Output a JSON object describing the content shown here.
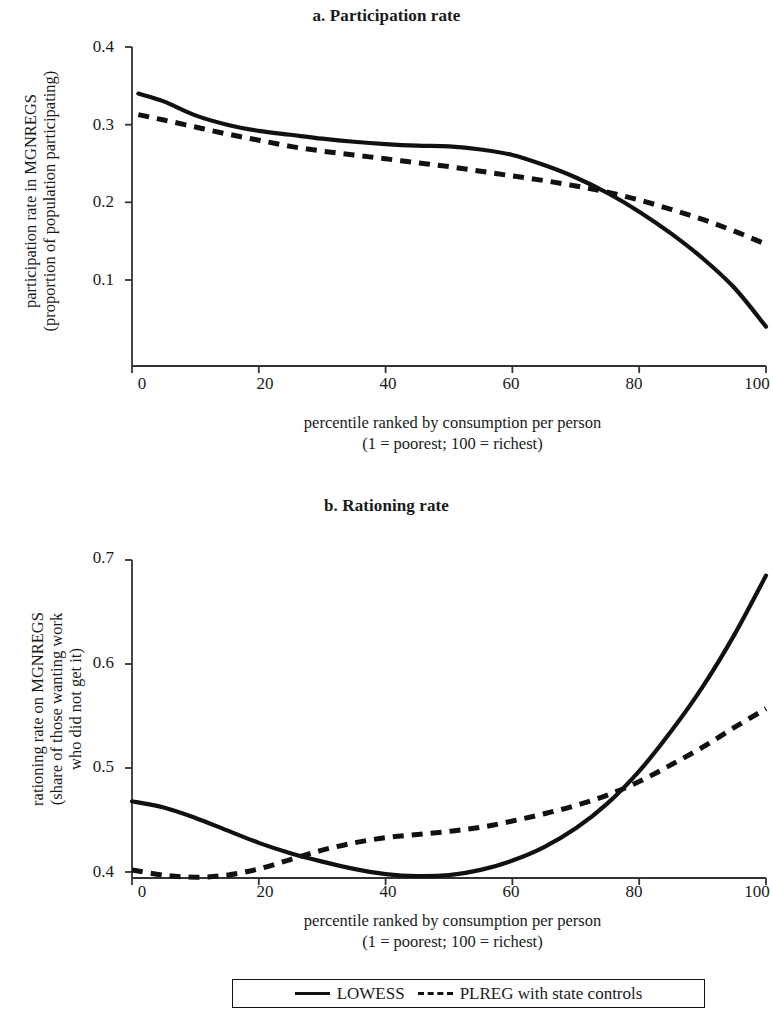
{
  "figure": {
    "panels": [
      {
        "id": "a",
        "title": "a. Participation rate",
        "ylabel_line1": "participation rate in MGNREGS",
        "ylabel_line2": "(proportion of population participating)",
        "xlabel_line1": "percentile ranked by consumption per person",
        "xlabel_line2": "(1 = poorest; 100 = richest)",
        "yticks": [
          "0.4",
          "0.3",
          "0.2",
          "0.1"
        ],
        "xticks": [
          "0",
          "20",
          "40",
          "60",
          "80",
          "100"
        ]
      },
      {
        "id": "b",
        "title": "b. Rationing rate",
        "ylabel_line1": "rationing rate on MGNREGS",
        "ylabel_line2": "(share of those wanting work",
        "ylabel_line3": "who did not get it)",
        "xlabel_line1": "percentile ranked by consumption per person",
        "xlabel_line2": "(1 = poorest; 100 = richest)",
        "yticks": [
          "0.7",
          "0.6",
          "0.5",
          "0.4"
        ],
        "xticks": [
          "0",
          "20",
          "40",
          "60",
          "80",
          "100"
        ]
      }
    ],
    "legend": {
      "items": [
        {
          "label": "LOWESS",
          "style": "solid"
        },
        {
          "label": "PLREG with state controls",
          "style": "dashed"
        }
      ]
    },
    "colors": {
      "line": "#111111",
      "axis": "#333333",
      "background": "#ffffff"
    }
  },
  "chart_data": [
    {
      "type": "line",
      "title": "a. Participation rate",
      "xlabel": "percentile ranked by consumption per person (1 = poorest; 100 = richest)",
      "ylabel": "participation rate in MGNREGS (proportion of population participating)",
      "xlim": [
        0,
        100
      ],
      "ylim": [
        0.0,
        0.4
      ],
      "xticks": [
        0,
        20,
        40,
        60,
        80,
        100
      ],
      "yticks": [
        0.1,
        0.2,
        0.3,
        0.4
      ],
      "grid": false,
      "legend_position": "below-figure",
      "x": [
        1,
        5,
        10,
        15,
        20,
        25,
        30,
        35,
        40,
        45,
        50,
        55,
        60,
        65,
        70,
        75,
        80,
        85,
        90,
        95,
        100
      ],
      "series": [
        {
          "name": "LOWESS",
          "style": "solid",
          "values": [
            0.34,
            0.33,
            0.312,
            0.3,
            0.292,
            0.287,
            0.282,
            0.278,
            0.275,
            0.273,
            0.272,
            0.268,
            0.261,
            0.248,
            0.232,
            0.212,
            0.188,
            0.16,
            0.128,
            0.09,
            0.04
          ]
        },
        {
          "name": "PLREG with state controls",
          "style": "dashed",
          "values": [
            0.313,
            0.306,
            0.297,
            0.288,
            0.28,
            0.272,
            0.266,
            0.261,
            0.256,
            0.251,
            0.246,
            0.24,
            0.234,
            0.228,
            0.221,
            0.213,
            0.203,
            0.191,
            0.178,
            0.163,
            0.146
          ]
        }
      ]
    },
    {
      "type": "line",
      "title": "b. Rationing rate",
      "xlabel": "percentile ranked by consumption per person (1 = poorest; 100 = richest)",
      "ylabel": "rationing rate on MGNREGS (share of those wanting work who did not get it)",
      "xlim": [
        0,
        100
      ],
      "ylim": [
        0.37,
        0.7
      ],
      "xticks": [
        0,
        20,
        40,
        60,
        80,
        100
      ],
      "yticks": [
        0.4,
        0.5,
        0.6,
        0.7
      ],
      "grid": false,
      "legend_position": "below-figure",
      "x": [
        0,
        5,
        10,
        15,
        20,
        25,
        30,
        35,
        40,
        45,
        50,
        55,
        60,
        65,
        70,
        75,
        80,
        85,
        90,
        95,
        100
      ],
      "series": [
        {
          "name": "LOWESS",
          "style": "solid",
          "values": [
            0.468,
            0.462,
            0.452,
            0.44,
            0.428,
            0.418,
            0.41,
            0.403,
            0.398,
            0.396,
            0.397,
            0.402,
            0.411,
            0.424,
            0.442,
            0.466,
            0.497,
            0.535,
            0.578,
            0.628,
            0.685
          ]
        },
        {
          "name": "PLREG with state controls",
          "style": "dashed",
          "values": [
            0.402,
            0.397,
            0.395,
            0.397,
            0.403,
            0.412,
            0.421,
            0.428,
            0.433,
            0.436,
            0.439,
            0.443,
            0.449,
            0.456,
            0.464,
            0.474,
            0.487,
            0.503,
            0.52,
            0.539,
            0.557
          ]
        }
      ]
    }
  ]
}
